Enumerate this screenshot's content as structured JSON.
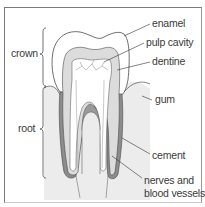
{
  "diagram": {
    "labels": {
      "enamel": "enamel",
      "pulp_cavity": "pulp cavity",
      "dentine": "dentine",
      "gum": "gum",
      "cement": "cement",
      "nerves_line1": "nerves and",
      "nerves_line2": "blood vessels",
      "crown": "crown",
      "root": "root"
    },
    "colors": {
      "frame": "#7a7a7a",
      "enamel": "#ffffff",
      "dentine": "#dcdcdc",
      "pulp": "#ffffff",
      "gum": "#e6e6e6",
      "cement": "#8c8c8c",
      "blood_core": "#9a9a9a",
      "outline": "#4a4a4a",
      "text": "#3a3a3a"
    }
  }
}
